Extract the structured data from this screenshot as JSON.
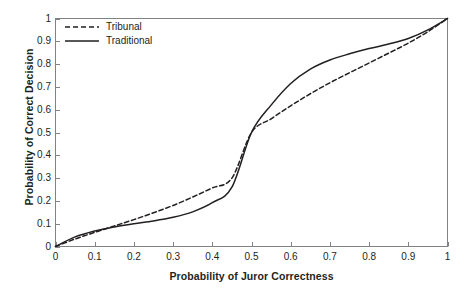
{
  "chart_data": {
    "type": "line",
    "title": "",
    "xlabel": "Probability of Juror Correctness",
    "ylabel": "Probability of Correct Decision",
    "xlim": [
      0,
      1
    ],
    "ylim": [
      0,
      1
    ],
    "grid": false,
    "legend_position": "top-left",
    "xticklabels": [
      "0",
      "0.1",
      "0.2",
      "0.3",
      "0.4",
      "0.5",
      "0.6",
      "0.7",
      "0.8",
      "0.9",
      "1"
    ],
    "yticklabels": [
      "0",
      "0.1",
      "0.2",
      "0.3",
      "0.4",
      "0.5",
      "0.6",
      "0.7",
      "0.8",
      "0.9",
      "1"
    ],
    "xticks": [
      0,
      0.1,
      0.2,
      0.3,
      0.4,
      0.5,
      0.6,
      0.7,
      0.8,
      0.9,
      1
    ],
    "yticks": [
      0,
      0.1,
      0.2,
      0.3,
      0.4,
      0.5,
      0.6,
      0.7,
      0.8,
      0.9,
      1
    ],
    "x": [
      0,
      0.05,
      0.1,
      0.15,
      0.2,
      0.25,
      0.3,
      0.35,
      0.4,
      0.45,
      0.5,
      0.55,
      0.6,
      0.65,
      0.7,
      0.75,
      0.8,
      0.85,
      0.9,
      0.95,
      1
    ],
    "series": [
      {
        "name": "Tribunal",
        "style": "dashed",
        "color": "#231f20",
        "values": [
          0,
          0.033,
          0.062,
          0.09,
          0.118,
          0.148,
          0.18,
          0.217,
          0.257,
          0.3,
          0.5,
          0.56,
          0.617,
          0.67,
          0.718,
          0.762,
          0.805,
          0.848,
          0.892,
          0.942,
          1
        ]
      },
      {
        "name": "Traditional",
        "style": "solid",
        "color": "#231f20",
        "values": [
          0,
          0.042,
          0.068,
          0.086,
          0.1,
          0.112,
          0.128,
          0.152,
          0.192,
          0.26,
          0.5,
          0.62,
          0.715,
          0.778,
          0.818,
          0.845,
          0.868,
          0.888,
          0.912,
          0.95,
          1
        ]
      }
    ],
    "annotations": [
      "Curves intersect near x = 0.15, x = 0.50 and x = 0.85",
      "Both curves pass through (0, 0) and (1, 1)"
    ]
  },
  "legend": {
    "items": [
      {
        "label": "Tribunal",
        "style": "dashed"
      },
      {
        "label": "Traditional",
        "style": "solid"
      }
    ]
  },
  "colors": {
    "axis": "#808285",
    "line": "#231f20",
    "text": "#231f20",
    "background": "#ffffff"
  }
}
